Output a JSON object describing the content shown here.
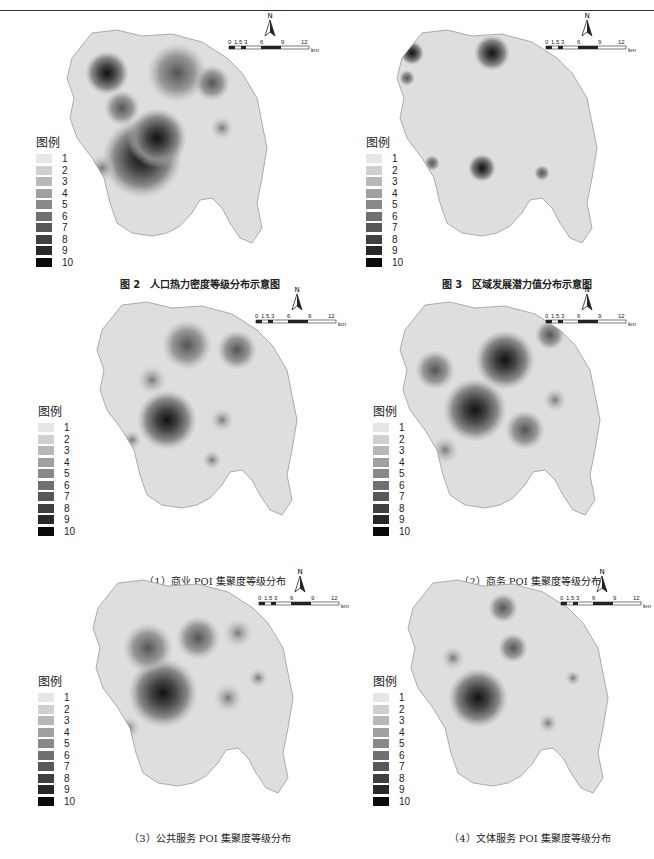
{
  "header": {
    "text": "研究 · 空间分析"
  },
  "legend": {
    "title": "图例",
    "items": [
      "1",
      "2",
      "3",
      "4",
      "5",
      "6",
      "7",
      "8",
      "9",
      "10"
    ],
    "colors": [
      "#e6e6e6",
      "#d0d0d0",
      "#b8b8b8",
      "#a0a0a0",
      "#888888",
      "#707070",
      "#585858",
      "#404040",
      "#282828",
      "#0a0a0a"
    ]
  },
  "scalebar": {
    "ticks": [
      "0",
      "1.5",
      "3",
      "6",
      "9",
      "12"
    ],
    "unit": "km",
    "north": "N"
  },
  "figures": [
    {
      "id": "fig2",
      "caption": "图 2　人口热力密度等级分布示意图"
    },
    {
      "id": "fig3",
      "caption": "图 3　区域发展潜力值分布示意图"
    },
    {
      "id": "sub1",
      "caption": "（1）商业 POI 集聚度等级分布"
    },
    {
      "id": "sub2",
      "caption": "（2）商务 POI 集聚度等级分布"
    },
    {
      "id": "sub3",
      "caption": "（3）公共服务 POI 集聚度等级分布"
    },
    {
      "id": "sub4",
      "caption": "（4）文体服务 POI 集聚度等级分布"
    }
  ]
}
